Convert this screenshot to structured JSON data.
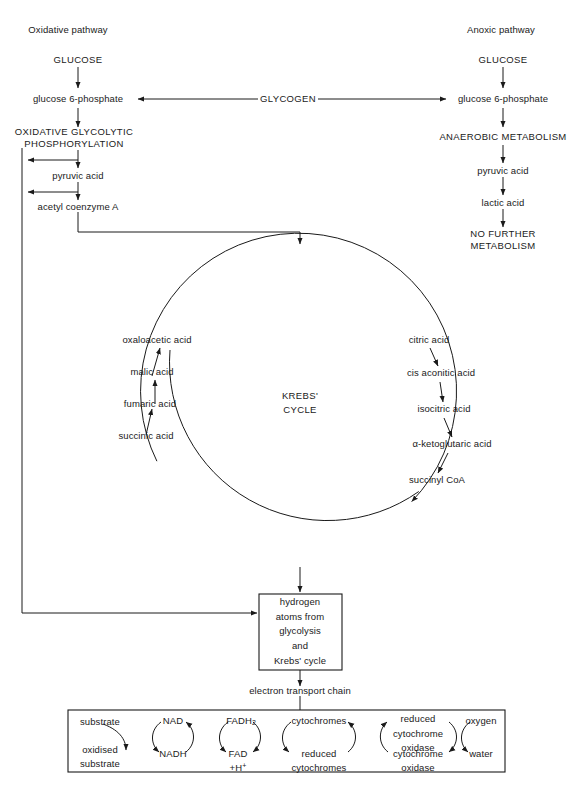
{
  "diagram": {
    "headers": {
      "left": "Oxidative pathway",
      "right": "Anoxic pathway"
    },
    "bridge": {
      "label": "GLYCOGEN"
    },
    "left_pathway": [
      {
        "label": "GLUCOSE"
      },
      {
        "label": "glucose 6-phosphate"
      },
      {
        "label": "OXIDATIVE GLYCOLYTIC\nPHOSPHORYLATION"
      },
      {
        "label": "pyruvic acid"
      },
      {
        "label": "acetyl coenzyme A"
      }
    ],
    "right_pathway": [
      {
        "label": "GLUCOSE"
      },
      {
        "label": "glucose 6-phosphate"
      },
      {
        "label": "ANAEROBIC METABOLISM"
      },
      {
        "label": "pyruvic acid"
      },
      {
        "label": "lactic acid"
      },
      {
        "label": "NO FURTHER\nMETABOLISM"
      }
    ],
    "krebs": {
      "center_label": "KREBS'\nCYCLE",
      "left_branch": [
        {
          "label": "oxaloacetic acid"
        },
        {
          "label": "malic acid"
        },
        {
          "label": "fumaric acid"
        },
        {
          "label": "succinic acid"
        }
      ],
      "right_branch": [
        {
          "label": "citric acid"
        },
        {
          "label": "cis aconitic acid"
        },
        {
          "label": "isocitric acid"
        },
        {
          "label": "α-ketoglutaric acid"
        },
        {
          "label": "succinyl CoA"
        }
      ]
    },
    "hydrogen_box": {
      "label": "hydrogen\natoms from\nglycolysis\nand\nKrebs' cycle"
    },
    "etc_label": "electron transport chain",
    "etc_couples": [
      {
        "top": "substrate",
        "bottom": "oxidised\nsubstrate",
        "direction": "down"
      },
      {
        "top": "NAD",
        "bottom": "NADH",
        "direction": "both"
      },
      {
        "top": "FADH2",
        "bottom": "FAD\n+H+",
        "direction": "both"
      },
      {
        "top": "cytochromes",
        "bottom": "reduced\ncytochromes",
        "direction": "both"
      },
      {
        "top": "reduced\ncytochrome\noxidase",
        "bottom": "cytochrome\noxidase",
        "direction": "both"
      },
      {
        "top": "oxygen",
        "bottom": "water",
        "direction": "down"
      }
    ]
  },
  "colors": {
    "ink": "#1a1a1a",
    "background": "#ffffff"
  }
}
